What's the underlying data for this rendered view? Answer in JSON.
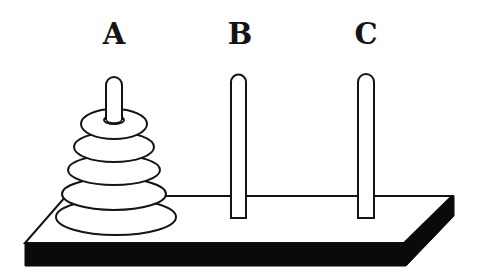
{
  "colors": {
    "stroke": "#141414",
    "fill": "#ffffff",
    "base_shadow": "#0a0a0a"
  },
  "pegs": [
    {
      "label": "A",
      "x": 114,
      "label_y": 20,
      "disks": 5
    },
    {
      "label": "B",
      "x": 239,
      "label_y": 20,
      "disks": 0
    },
    {
      "label": "C",
      "x": 366,
      "label_y": 20,
      "disks": 0
    }
  ],
  "disks": [
    {
      "index": 1,
      "peg": "A",
      "size": "smallest",
      "cx": 114,
      "cy": 124,
      "rx": 33,
      "ry": 15
    },
    {
      "index": 2,
      "peg": "A",
      "size": "small",
      "cx": 114,
      "cy": 147,
      "rx": 40,
      "ry": 15
    },
    {
      "index": 3,
      "peg": "A",
      "size": "medium",
      "cx": 114,
      "cy": 170,
      "rx": 46,
      "ry": 15
    },
    {
      "index": 4,
      "peg": "A",
      "size": "large",
      "cx": 114,
      "cy": 194,
      "rx": 52,
      "ry": 16
    },
    {
      "index": 5,
      "peg": "A",
      "size": "largest",
      "cx": 116,
      "cy": 217,
      "rx": 60,
      "ry": 18
    }
  ]
}
